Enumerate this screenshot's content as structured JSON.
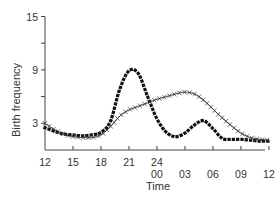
{
  "chart_data": {
    "type": "line",
    "title": "",
    "xlabel": "Time",
    "ylabel": "Birth frequency",
    "ylim": [
      0,
      15
    ],
    "yticks": [
      3,
      9,
      15
    ],
    "yminor_ticks": [
      6,
      12
    ],
    "x_tick_labels": [
      "12",
      "15",
      "18",
      "21",
      "24\n00",
      "03",
      "06",
      "09",
      "12"
    ],
    "x_hours": [
      12,
      13,
      14,
      15,
      16,
      17,
      18,
      19,
      20,
      21,
      22,
      23,
      24,
      25,
      26,
      27,
      28,
      29,
      30,
      31,
      32,
      33,
      34,
      35,
      36
    ],
    "series": [
      {
        "name": "dotted",
        "style": "dotted",
        "values": [
          2.5,
          2.1,
          1.8,
          1.7,
          1.6,
          1.7,
          2.0,
          3.2,
          6.8,
          8.9,
          8.6,
          6.0,
          3.5,
          2.0,
          1.5,
          1.9,
          2.8,
          3.3,
          2.4,
          1.3,
          1.2,
          1.2,
          1.1,
          1.0,
          1.0
        ]
      },
      {
        "name": "crossed",
        "style": "line-with-crosses",
        "values": [
          3.0,
          2.3,
          1.8,
          1.5,
          1.4,
          1.4,
          1.7,
          2.6,
          3.8,
          4.5,
          4.9,
          5.3,
          5.7,
          6.0,
          6.3,
          6.5,
          6.3,
          5.6,
          4.6,
          3.6,
          2.7,
          1.9,
          1.4,
          1.2,
          1.1
        ]
      }
    ],
    "grid": false,
    "legend": null
  }
}
